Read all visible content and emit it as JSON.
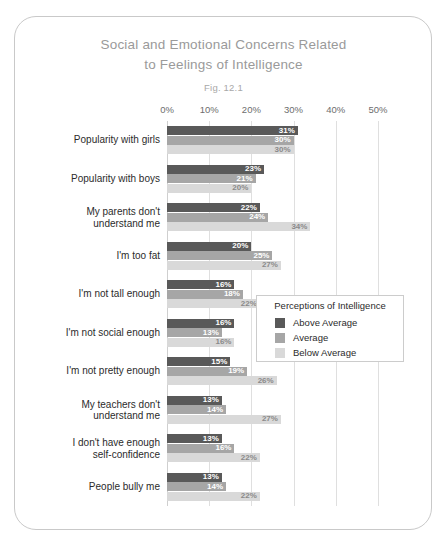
{
  "figure": {
    "title_line1": "Social and Emotional Concerns Related",
    "title_line2": "to Feelings of Intelligence",
    "figure_number": "Fig. 12.1"
  },
  "legend": {
    "title": "Perceptions of Intelligence",
    "items": [
      {
        "label": "Above Average",
        "color": "#595959"
      },
      {
        "label": "Average",
        "color": "#a6a6a6"
      },
      {
        "label": "Below Average",
        "color": "#d9d9d9"
      }
    ]
  },
  "chart_data": {
    "type": "bar",
    "orientation": "horizontal",
    "title": "Social and Emotional Concerns Related to Feelings of Intelligence",
    "subtitle": "Fig. 12.1",
    "xlabel": "",
    "ylabel": "",
    "xlim": [
      0,
      55
    ],
    "xticks": [
      "0%",
      "10%",
      "20%",
      "30%",
      "40%",
      "50%"
    ],
    "xtick_values": [
      0,
      10,
      20,
      30,
      40,
      50
    ],
    "grid": true,
    "legend_position": "middle-right",
    "categories": [
      "Popularity with girls",
      "Popularity with boys",
      "My parents don't\nunderstand me",
      "I'm too fat",
      "I'm not tall enough",
      "I'm not social enough",
      "I'm not pretty enough",
      "My teachers don't\nunderstand me",
      "I don't have enough\nself-confidence",
      "People bully me"
    ],
    "series": [
      {
        "name": "Above Average",
        "color": "#595959",
        "values": [
          31,
          23,
          22,
          20,
          16,
          16,
          15,
          13,
          13,
          13
        ],
        "labels": [
          "31%",
          "23%",
          "22%",
          "20%",
          "16%",
          "16%",
          "15%",
          "13%",
          "13%",
          "13%"
        ]
      },
      {
        "name": "Average",
        "color": "#a6a6a6",
        "values": [
          30,
          21,
          24,
          25,
          18,
          13,
          19,
          14,
          16,
          14
        ],
        "labels": [
          "30%",
          "21%",
          "24%",
          "25%",
          "18%",
          "13%",
          "19%",
          "14%",
          "16%",
          "14%"
        ]
      },
      {
        "name": "Below Average",
        "color": "#d9d9d9",
        "values": [
          30,
          20,
          34,
          27,
          22,
          16,
          26,
          27,
          22,
          22
        ],
        "labels": [
          "30%",
          "20%",
          "34%",
          "27%",
          "22%",
          "16%",
          "26%",
          "27%",
          "22%",
          "22%"
        ]
      }
    ]
  }
}
